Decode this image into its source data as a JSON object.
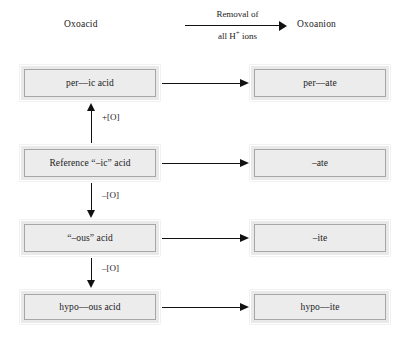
{
  "diagram": {
    "title_columns": {
      "left": "Oxoacid",
      "right": "Oxoanion"
    },
    "top_arrow": {
      "label_line1": "Removal of",
      "label_line2_before": "all H",
      "label_line2_sup": "+",
      "label_line2_after": " ions",
      "direction": "right"
    },
    "rows": [
      {
        "acid": "per––ic acid",
        "anion": "per––ate"
      },
      {
        "acid": "Reference “–ic” acid",
        "anion": "–ate"
      },
      {
        "acid": "“–ous” acid",
        "anion": "–ite"
      },
      {
        "acid": "hypo––ous acid",
        "anion": "hypo––ite"
      }
    ],
    "vertical_steps": [
      {
        "label": "+[O]",
        "direction": "up",
        "from": "Reference “–ic” acid",
        "to": "per––ic acid"
      },
      {
        "label": "–[O]",
        "direction": "down",
        "from": "Reference “–ic” acid",
        "to": "“–ous” acid"
      },
      {
        "label": "–[O]",
        "direction": "down",
        "from": "“–ous” acid",
        "to": "hypo––ous acid"
      }
    ],
    "colors": {
      "box_fill": "#ececec",
      "box_border": "#a6a6a6",
      "box_outer_frame": "#ffffff",
      "arrow": "#111111",
      "text": "#1a1a1a",
      "background": "#ffffff"
    }
  }
}
